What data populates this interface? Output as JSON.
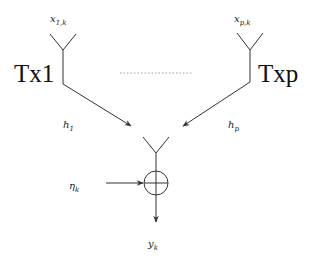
{
  "diagram": {
    "type": "multi-antenna transmission to single receiver with additive noise",
    "transmitters": [
      {
        "id": "tx1",
        "label": "Tx1",
        "signal": {
          "base": "x",
          "sub": "1,k"
        },
        "channel": {
          "base": "h",
          "sub": "1"
        }
      },
      {
        "id": "txp",
        "label": "Txp",
        "signal": {
          "base": "x",
          "sub": "p,k"
        },
        "channel": {
          "base": "h",
          "sub": "p"
        }
      }
    ],
    "ellipsis": "……",
    "noise": {
      "base": "η",
      "sub": "k"
    },
    "output": {
      "base": "y",
      "sub": "k"
    },
    "adder_symbol": "⊕",
    "colors": {
      "stroke": "#333333",
      "text": "#222222",
      "dots": "#888888"
    }
  }
}
